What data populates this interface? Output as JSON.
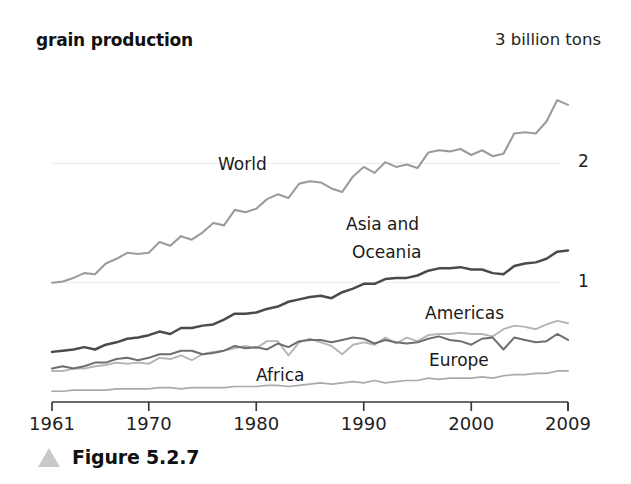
{
  "figure": {
    "title": "grain production",
    "unit_note": "3 billion tons",
    "caption": "Figure 5.2.7",
    "caption_icon": "triangle-up-icon"
  },
  "chart_data": {
    "type": "line",
    "title": "grain production",
    "subtitle": "",
    "xlabel": "",
    "ylabel": "3 billion tons",
    "xlim": [
      1961,
      2009
    ],
    "ylim": [
      0,
      3
    ],
    "x_ticks": [
      1961,
      1970,
      1980,
      1990,
      2000,
      2009
    ],
    "y_gridlines": [
      1,
      2
    ],
    "y_gridline_labels": [
      "1",
      "2"
    ],
    "grid": true,
    "legend": "inline-labels",
    "annotations": [
      {
        "text": "World",
        "x": 1976,
        "y": 2.02
      },
      {
        "text": "Asia and",
        "x": 1990,
        "y": 1.55
      },
      {
        "text": "Oceania",
        "x": 1990,
        "y": 1.33
      },
      {
        "text": "Americas",
        "x": 2000,
        "y": 0.82
      },
      {
        "text": "Europe",
        "x": 2000,
        "y": 0.43
      },
      {
        "text": "Africa",
        "x": 1983,
        "y": 0.26
      }
    ],
    "x": [
      1961,
      1962,
      1963,
      1964,
      1965,
      1966,
      1967,
      1968,
      1969,
      1970,
      1971,
      1972,
      1973,
      1974,
      1975,
      1976,
      1977,
      1978,
      1979,
      1980,
      1981,
      1982,
      1983,
      1984,
      1985,
      1986,
      1987,
      1988,
      1989,
      1990,
      1991,
      1992,
      1993,
      1994,
      1995,
      1996,
      1997,
      1998,
      1999,
      2000,
      2001,
      2002,
      2003,
      2004,
      2005,
      2006,
      2007,
      2008,
      2009
    ],
    "series": [
      {
        "name": "World",
        "color": "#9b9b9b",
        "width": 2.1,
        "values": [
          1.0,
          1.01,
          1.04,
          1.08,
          1.07,
          1.16,
          1.2,
          1.25,
          1.24,
          1.25,
          1.34,
          1.31,
          1.39,
          1.36,
          1.42,
          1.5,
          1.48,
          1.61,
          1.59,
          1.62,
          1.7,
          1.74,
          1.71,
          1.83,
          1.85,
          1.84,
          1.79,
          1.76,
          1.89,
          1.97,
          1.92,
          2.01,
          1.97,
          1.99,
          1.96,
          2.09,
          2.11,
          2.1,
          2.12,
          2.07,
          2.11,
          2.06,
          2.08,
          2.25,
          2.26,
          2.25,
          2.35,
          2.53,
          2.49
        ]
      },
      {
        "name": "Asia and Oceania",
        "color": "#4a4a4a",
        "width": 2.5,
        "values": [
          0.42,
          0.43,
          0.44,
          0.46,
          0.44,
          0.48,
          0.5,
          0.53,
          0.54,
          0.56,
          0.59,
          0.57,
          0.62,
          0.62,
          0.64,
          0.65,
          0.69,
          0.74,
          0.74,
          0.75,
          0.78,
          0.8,
          0.84,
          0.86,
          0.88,
          0.89,
          0.87,
          0.92,
          0.95,
          0.99,
          0.99,
          1.03,
          1.04,
          1.04,
          1.06,
          1.1,
          1.12,
          1.12,
          1.13,
          1.11,
          1.11,
          1.08,
          1.07,
          1.14,
          1.16,
          1.17,
          1.2,
          1.26,
          1.27
        ]
      },
      {
        "name": "Americas",
        "color": "#b5b5b5",
        "width": 1.9,
        "values": [
          0.26,
          0.26,
          0.28,
          0.28,
          0.3,
          0.31,
          0.33,
          0.32,
          0.33,
          0.32,
          0.37,
          0.36,
          0.39,
          0.35,
          0.4,
          0.42,
          0.43,
          0.45,
          0.47,
          0.45,
          0.51,
          0.51,
          0.39,
          0.5,
          0.53,
          0.5,
          0.47,
          0.4,
          0.48,
          0.5,
          0.48,
          0.54,
          0.49,
          0.54,
          0.51,
          0.56,
          0.57,
          0.57,
          0.58,
          0.57,
          0.57,
          0.55,
          0.61,
          0.64,
          0.63,
          0.61,
          0.65,
          0.68,
          0.66
        ]
      },
      {
        "name": "Europe",
        "color": "#6e6e6e",
        "width": 2.0,
        "values": [
          0.28,
          0.3,
          0.28,
          0.3,
          0.33,
          0.33,
          0.36,
          0.37,
          0.35,
          0.37,
          0.4,
          0.4,
          0.43,
          0.43,
          0.4,
          0.41,
          0.43,
          0.47,
          0.45,
          0.46,
          0.44,
          0.49,
          0.46,
          0.51,
          0.52,
          0.52,
          0.5,
          0.52,
          0.54,
          0.53,
          0.49,
          0.52,
          0.5,
          0.49,
          0.5,
          0.53,
          0.55,
          0.52,
          0.51,
          0.48,
          0.53,
          0.54,
          0.44,
          0.54,
          0.52,
          0.5,
          0.51,
          0.57,
          0.52
        ]
      },
      {
        "name": "Africa",
        "color": "#aaaaaa",
        "width": 1.7,
        "values": [
          0.09,
          0.09,
          0.1,
          0.1,
          0.1,
          0.1,
          0.11,
          0.11,
          0.11,
          0.11,
          0.12,
          0.12,
          0.11,
          0.12,
          0.12,
          0.12,
          0.12,
          0.13,
          0.13,
          0.13,
          0.14,
          0.14,
          0.13,
          0.14,
          0.15,
          0.16,
          0.15,
          0.16,
          0.17,
          0.16,
          0.18,
          0.16,
          0.17,
          0.18,
          0.18,
          0.2,
          0.19,
          0.2,
          0.2,
          0.2,
          0.21,
          0.2,
          0.22,
          0.23,
          0.23,
          0.24,
          0.24,
          0.26,
          0.26
        ]
      }
    ]
  }
}
